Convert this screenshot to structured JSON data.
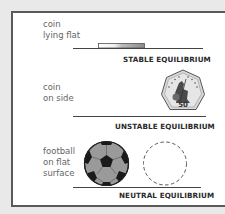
{
  "sections": [
    {
      "label_lines": [
        "coin",
        "lying flat"
      ],
      "caption": "STABLE EQUILIBRIUM",
      "object": "coin-flat"
    },
    {
      "label_lines": [
        "coin",
        "on side"
      ],
      "caption": "UNSTABLE EQUILIBRIUM",
      "object": "coin-on-edge",
      "coin_value": "50",
      "coin_text": "FIFTY PENCE"
    },
    {
      "label_lines": [
        "football",
        "on flat",
        "surface"
      ],
      "caption": "NEUTRAL EQUILIBRIUM",
      "object": "football",
      "ghost": "dashed-circle"
    }
  ],
  "colors": {
    "background": "#e9e9e9",
    "panel": "#ffffff",
    "frame": "#5a5a5a",
    "ball_grey": "#9a9a9a",
    "ball_black": "#1a1a1a"
  }
}
